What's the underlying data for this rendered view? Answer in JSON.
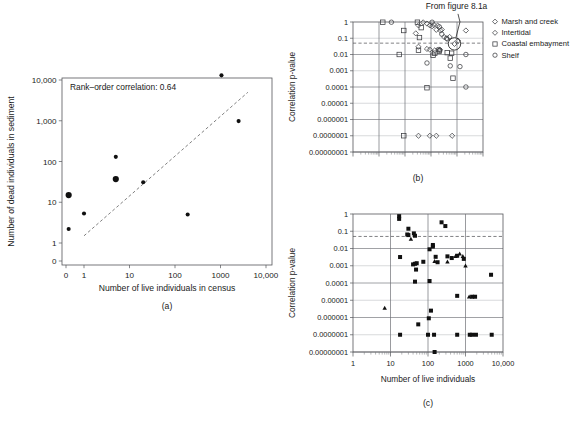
{
  "figure": {
    "panels": [
      "a",
      "b",
      "c"
    ],
    "labels": {
      "a": "(a)",
      "b": "(b)",
      "c": "(c)"
    }
  },
  "panel_a": {
    "annotation": "Rank–order correlation: 0.64",
    "xlabel": "Number of live individuals in census",
    "ylabel": "Number of dead individuals in sediment",
    "caption": "(a)",
    "xticks": [
      "0",
      "1",
      "10",
      "100",
      "1000",
      "10,000"
    ],
    "yticks": [
      "0",
      "1",
      "10",
      "100",
      "1,000",
      "10,000"
    ]
  },
  "panel_b": {
    "ylabel": "Correlation p-value",
    "caption": "(b)",
    "note": "From figure 8.1a",
    "yticks": [
      "1",
      "0.1",
      "0.01",
      "0.001",
      "0.0001",
      "0.00001",
      "0.000001",
      "0.0000001",
      "0.00000001"
    ],
    "legend": [
      {
        "label": "Marsh and creek",
        "marker": "diamond-open"
      },
      {
        "label": "Intertidal",
        "marker": "diamond-open"
      },
      {
        "label": "Coastal embayment",
        "marker": "square-open"
      },
      {
        "label": "Shelf",
        "marker": "circle-open"
      }
    ]
  },
  "panel_c": {
    "ylabel": "Correlation p-value",
    "xlabel": "Number of live individuals",
    "caption": "(c)",
    "xticks": [
      "1",
      "10",
      "100",
      "1000",
      "10,000"
    ],
    "yticks": [
      "1",
      "0.1",
      "0.01",
      "0.001",
      "0.0001",
      "0.00001",
      "0.000001",
      "0.0000001",
      "0.00000001"
    ]
  },
  "chart_data": [
    {
      "id": "panel-a",
      "type": "scatter",
      "title": "",
      "xlabel": "Number of live individuals in census",
      "ylabel": "Number of dead individuals in sediment",
      "annotation": "Rank–order correlation: 0.64",
      "xscale": "log",
      "yscale": "log",
      "xlim": [
        0.2,
        10000
      ],
      "ylim": [
        1,
        10000
      ],
      "grid": false,
      "reference_line": {
        "style": "dashed",
        "from": [
          1,
          1.5
        ],
        "to": [
          4000,
          5000
        ]
      },
      "points": [
        {
          "x": 0.3,
          "y": 15,
          "size": "large"
        },
        {
          "x": 0.3,
          "y": 2.2,
          "size": "small"
        },
        {
          "x": 1.0,
          "y": 5.3,
          "size": "small"
        },
        {
          "x": 5.0,
          "y": 130,
          "size": "small"
        },
        {
          "x": 5.0,
          "y": 37,
          "size": "large"
        },
        {
          "x": 20,
          "y": 31,
          "size": "small"
        },
        {
          "x": 190,
          "y": 5.0,
          "size": "small"
        },
        {
          "x": 1050,
          "y": 13000,
          "size": "small"
        },
        {
          "x": 2500,
          "y": 980,
          "size": "small"
        }
      ]
    },
    {
      "id": "panel-b",
      "type": "scatter",
      "title": "",
      "xlabel": "",
      "ylabel": "Correlation p-value",
      "xscale": "log",
      "yscale": "log",
      "xlim": [
        1,
        100000
      ],
      "ylim": [
        1e-08,
        1
      ],
      "grid": true,
      "threshold_line": {
        "value": 0.05,
        "style": "dashed"
      },
      "legend_position": "right",
      "annotation": {
        "text": "From figure 8.1a",
        "points_to": [
          8000,
          0.045
        ]
      },
      "series": [
        {
          "name": "Marsh and creek",
          "marker": "diamond-open",
          "points": [
            {
              "x": 330,
              "y": 0.62
            },
            {
              "x": 700,
              "y": 0.8
            },
            {
              "x": 900,
              "y": 0.62
            },
            {
              "x": 1100,
              "y": 0.55
            },
            {
              "x": 1600,
              "y": 0.33
            },
            {
              "x": 2300,
              "y": 0.3
            },
            {
              "x": 3200,
              "y": 0.12
            },
            {
              "x": 4200,
              "y": 0.09
            },
            {
              "x": 8000,
              "y": 0.045
            },
            {
              "x": 11000,
              "y": 0.07
            },
            {
              "x": 22000,
              "y": 0.3
            },
            {
              "x": 260,
              "y": 0.2
            },
            {
              "x": 330,
              "y": 0.03
            },
            {
              "x": 700,
              "y": 0.022
            },
            {
              "x": 900,
              "y": 0.02
            },
            {
              "x": 1400,
              "y": 0.018
            },
            {
              "x": 2200,
              "y": 0.02
            },
            {
              "x": 330,
              "y": 1e-07
            },
            {
              "x": 900,
              "y": 1e-07
            },
            {
              "x": 1600,
              "y": 1e-07
            },
            {
              "x": 6500,
              "y": 1e-07
            }
          ]
        },
        {
          "name": "Intertidal",
          "marker": "diamond-open",
          "points": [
            {
              "x": 500,
              "y": 0.95
            },
            {
              "x": 1300,
              "y": 0.66
            },
            {
              "x": 1800,
              "y": 0.6
            },
            {
              "x": 2600,
              "y": 0.34
            },
            {
              "x": 5200,
              "y": 0.12
            }
          ]
        },
        {
          "name": "Coastal embayment",
          "marker": "square-open",
          "points": [
            {
              "x": 14,
              "y": 0.97
            },
            {
              "x": 90,
              "y": 0.3
            },
            {
              "x": 300,
              "y": 0.97
            },
            {
              "x": 420,
              "y": 0.45
            },
            {
              "x": 360,
              "y": 0.11
            },
            {
              "x": 330,
              "y": 0.018
            },
            {
              "x": 60,
              "y": 0.01
            },
            {
              "x": 1200,
              "y": 0.009
            },
            {
              "x": 1400,
              "y": 0.012
            },
            {
              "x": 4200,
              "y": 0.013
            },
            {
              "x": 6200,
              "y": 0.012
            },
            {
              "x": 5500,
              "y": 0.006
            },
            {
              "x": 7000,
              "y": 0.00035
            },
            {
              "x": 700,
              "y": 9e-05
            },
            {
              "x": 90,
              "y": 1e-07
            },
            {
              "x": 2100,
              "y": 0.016
            }
          ]
        },
        {
          "name": "Shelf",
          "marker": "circle-open",
          "points": [
            {
              "x": 30,
              "y": 0.97
            },
            {
              "x": 1100,
              "y": 0.97
            },
            {
              "x": 2100,
              "y": 0.5
            },
            {
              "x": 2600,
              "y": 0.18
            },
            {
              "x": 4000,
              "y": 0.1
            },
            {
              "x": 1900,
              "y": 0.02
            },
            {
              "x": 2200,
              "y": 0.018
            },
            {
              "x": 700,
              "y": 0.003
            },
            {
              "x": 5500,
              "y": 0.002
            },
            {
              "x": 13000,
              "y": 0.0018
            },
            {
              "x": 22000,
              "y": 0.01
            },
            {
              "x": 22000,
              "y": 0.0001
            }
          ]
        }
      ]
    },
    {
      "id": "panel-c",
      "type": "scatter",
      "title": "",
      "xlabel": "Number of live individuals",
      "ylabel": "Correlation p-value",
      "xscale": "log",
      "yscale": "log",
      "xlim": [
        1,
        10000
      ],
      "ylim": [
        1e-08,
        1
      ],
      "grid": true,
      "threshold_line": {
        "value": 0.05,
        "style": "dashed"
      },
      "series": [
        {
          "name": "squares",
          "marker": "square-solid",
          "points": [
            {
              "x": 17,
              "y": 0.75
            },
            {
              "x": 17,
              "y": 0.52
            },
            {
              "x": 30,
              "y": 0.14
            },
            {
              "x": 28,
              "y": 0.065
            },
            {
              "x": 30,
              "y": 0.06
            },
            {
              "x": 42,
              "y": 0.075
            },
            {
              "x": 45,
              "y": 0.055
            },
            {
              "x": 230,
              "y": 0.33
            },
            {
              "x": 290,
              "y": 0.2
            },
            {
              "x": 110,
              "y": 0.009
            },
            {
              "x": 135,
              "y": 0.016
            },
            {
              "x": 135,
              "y": 0.013
            },
            {
              "x": 18,
              "y": 0.0032
            },
            {
              "x": 40,
              "y": 0.0012
            },
            {
              "x": 45,
              "y": 0.0013
            },
            {
              "x": 50,
              "y": 0.0014
            },
            {
              "x": 75,
              "y": 0.0017
            },
            {
              "x": 160,
              "y": 0.0033
            },
            {
              "x": 330,
              "y": 0.0035
            },
            {
              "x": 430,
              "y": 0.0028
            },
            {
              "x": 600,
              "y": 0.0038
            },
            {
              "x": 900,
              "y": 0.0025
            },
            {
              "x": 180,
              "y": 0.0016
            },
            {
              "x": 48,
              "y": 0.0006
            },
            {
              "x": 45,
              "y": 0.00012
            },
            {
              "x": 110,
              "y": 0.00013
            },
            {
              "x": 4800,
              "y": 0.0003
            },
            {
              "x": 600,
              "y": 1.8e-05
            },
            {
              "x": 1500,
              "y": 1.6e-05
            },
            {
              "x": 1800,
              "y": 1.6e-05
            },
            {
              "x": 120,
              "y": 2.5e-06
            },
            {
              "x": 105,
              "y": 9e-07
            },
            {
              "x": 55,
              "y": 4e-07
            },
            {
              "x": 18,
              "y": 1e-07
            },
            {
              "x": 100,
              "y": 1e-07
            },
            {
              "x": 145,
              "y": 1e-07
            },
            {
              "x": 600,
              "y": 1e-07
            },
            {
              "x": 1300,
              "y": 1e-07
            },
            {
              "x": 1500,
              "y": 1e-07
            },
            {
              "x": 1900,
              "y": 1e-07
            },
            {
              "x": 5000,
              "y": 1e-07
            },
            {
              "x": 150,
              "y": 1e-08
            }
          ]
        },
        {
          "name": "triangles",
          "marker": "triangle-solid",
          "points": [
            {
              "x": 35,
              "y": 0.035
            },
            {
              "x": 150,
              "y": 0.0018
            },
            {
              "x": 330,
              "y": 0.0017
            },
            {
              "x": 700,
              "y": 0.005
            },
            {
              "x": 850,
              "y": 0.0035
            },
            {
              "x": 1000,
              "y": 0.001
            },
            {
              "x": 7,
              "y": 3.5e-06
            },
            {
              "x": 1250,
              "y": 1.6e-05
            },
            {
              "x": 540,
              "y": 0.0035
            }
          ]
        }
      ]
    }
  ]
}
